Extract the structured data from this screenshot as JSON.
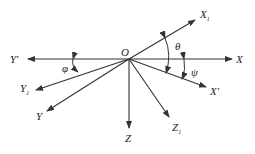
{
  "diagram": {
    "type": "coordinate-frame-rotation",
    "origin_label": "O",
    "axes": [
      {
        "id": "X",
        "label": "X",
        "sub": ""
      },
      {
        "id": "Yp",
        "label": "Y'",
        "sub": ""
      },
      {
        "id": "X1",
        "label": "X",
        "sub": "1"
      },
      {
        "id": "Xp",
        "label": "X'",
        "sub": ""
      },
      {
        "id": "Y1",
        "label": "Y",
        "sub": "1"
      },
      {
        "id": "Y",
        "label": "Y",
        "sub": ""
      },
      {
        "id": "Z",
        "label": "Z",
        "sub": ""
      },
      {
        "id": "Z1",
        "label": "Z",
        "sub": "1"
      }
    ],
    "angles": [
      {
        "id": "theta",
        "label": "θ"
      },
      {
        "id": "psi",
        "label": "ψ"
      },
      {
        "id": "phi",
        "label": "φ"
      }
    ]
  }
}
